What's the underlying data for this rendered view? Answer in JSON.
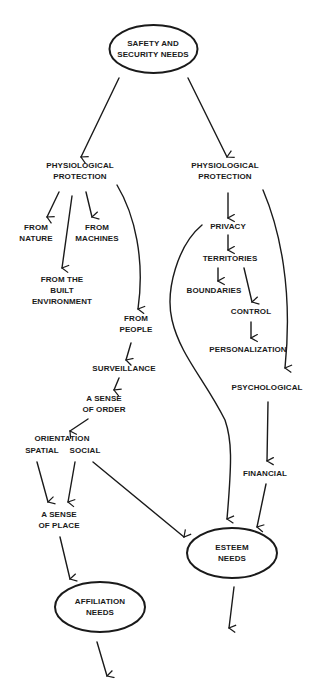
{
  "diagram": {
    "nodes": {
      "safety": {
        "line1": "SAFETY AND",
        "line2": "SECURITY NEEDS",
        "shape": "ellipse"
      },
      "phys_left": {
        "line1": "PHYSIOLOGICAL",
        "line2": "PROTECTION"
      },
      "phys_right": {
        "line1": "PHYSIOLOGICAL",
        "line2": "PROTECTION"
      },
      "from_nature": {
        "line1": "FROM",
        "line2": "NATURE"
      },
      "from_machines": {
        "line1": "FROM",
        "line2": "MACHINES"
      },
      "from_built": {
        "line1": "FROM THE",
        "line2": "BUILT",
        "line3": "ENVIRONMENT"
      },
      "from_people": {
        "line1": "FROM",
        "line2": "PEOPLE"
      },
      "surveillance": {
        "line1": "SURVEILLANCE"
      },
      "sense_order": {
        "line1": "A SENSE",
        "line2": "OF ORDER"
      },
      "orientation": {
        "line1": "ORIENTATION",
        "spatial": "SPATIAL",
        "social": "SOCIAL"
      },
      "sense_place": {
        "line1": "A SENSE",
        "line2": "OF PLACE"
      },
      "affiliation": {
        "line1": "AFFILIATION",
        "line2": "NEEDS",
        "shape": "ellipse"
      },
      "privacy": {
        "line1": "PRIVACY"
      },
      "territories": {
        "line1": "TERRITORIES"
      },
      "boundaries": {
        "line1": "BOUNDARIES"
      },
      "control": {
        "line1": "CONTROL"
      },
      "personalization": {
        "line1": "PERSONALIZATION"
      },
      "psychological": {
        "line1": "PSYCHOLOGICAL"
      },
      "financial": {
        "line1": "FINANCIAL"
      },
      "esteem": {
        "line1": "ESTEEM",
        "line2": "NEEDS",
        "shape": "ellipse"
      }
    },
    "edges": [
      {
        "from": "SAFETY AND SECURITY NEEDS",
        "to": "PHYSIOLOGICAL PROTECTION (left)"
      },
      {
        "from": "SAFETY AND SECURITY NEEDS",
        "to": "PHYSIOLOGICAL PROTECTION (right)"
      },
      {
        "from": "PHYSIOLOGICAL PROTECTION (left)",
        "to": "FROM NATURE"
      },
      {
        "from": "PHYSIOLOGICAL PROTECTION (left)",
        "to": "FROM THE BUILT ENVIRONMENT"
      },
      {
        "from": "PHYSIOLOGICAL PROTECTION (left)",
        "to": "FROM MACHINES"
      },
      {
        "from": "PHYSIOLOGICAL PROTECTION (left)",
        "to": "FROM PEOPLE"
      },
      {
        "from": "FROM PEOPLE",
        "to": "SURVEILLANCE"
      },
      {
        "from": "SURVEILLANCE",
        "to": "A SENSE OF ORDER"
      },
      {
        "from": "A SENSE OF ORDER",
        "to": "ORIENTATION"
      },
      {
        "from": "SPATIAL",
        "to": "A SENSE OF PLACE"
      },
      {
        "from": "SOCIAL",
        "to": "A SENSE OF PLACE"
      },
      {
        "from": "SOCIAL",
        "to": "ESTEEM NEEDS"
      },
      {
        "from": "A SENSE OF PLACE",
        "to": "AFFILIATION NEEDS"
      },
      {
        "from": "AFFILIATION NEEDS",
        "to": "(continues)"
      },
      {
        "from": "PHYSIOLOGICAL PROTECTION (right)",
        "to": "PRIVACY"
      },
      {
        "from": "PRIVACY",
        "to": "TERRITORIES"
      },
      {
        "from": "TERRITORIES",
        "to": "BOUNDARIES"
      },
      {
        "from": "TERRITORIES",
        "to": "CONTROL"
      },
      {
        "from": "CONTROL",
        "to": "PERSONALIZATION"
      },
      {
        "from": "PRIVACY",
        "to": "ESTEEM NEEDS"
      },
      {
        "from": "PHYSIOLOGICAL PROTECTION (right)",
        "to": "PSYCHOLOGICAL"
      },
      {
        "from": "PSYCHOLOGICAL",
        "to": "FINANCIAL"
      },
      {
        "from": "FINANCIAL",
        "to": "ESTEEM NEEDS"
      },
      {
        "from": "ESTEEM NEEDS",
        "to": "(continues)"
      }
    ],
    "colors": {
      "ink": "#1a1a1a",
      "background": "#ffffff"
    }
  }
}
